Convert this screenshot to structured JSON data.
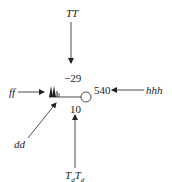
{
  "diagram": {
    "type": "weather station model",
    "labels": {
      "top": "TT",
      "left": "ff",
      "right": "hhh",
      "lower_left": "dd",
      "bottom_t1": "T",
      "bottom_sub1": "d",
      "bottom_t2": "T",
      "bottom_sub2": "d"
    },
    "values": {
      "temperature": "−29",
      "pressure_height": "540",
      "dewpoint_depression": "10"
    },
    "colors": {
      "ink": "#222222",
      "background": "#ffffff"
    }
  }
}
